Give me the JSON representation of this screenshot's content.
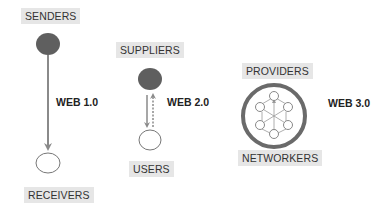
{
  "diagram": {
    "type": "web-evolution-comparison",
    "colors": {
      "filled_node": "#5f5f5f",
      "empty_node_stroke": "#777777",
      "arrow": "#8a8a8a",
      "ring": "#6a6a6a",
      "label_bg": "#e6e6e6",
      "label_text": "#333333"
    },
    "web1": {
      "version_label": "WEB 1.0",
      "top_label": "SENDERS",
      "bottom_label": "RECEIVERS",
      "flow": "one-way downward"
    },
    "web2": {
      "version_label": "WEB 2.0",
      "top_label": "SUPPLIERS",
      "bottom_label": "USERS",
      "flow": "two-way (solid down, dashed up)"
    },
    "web3": {
      "version_label": "WEB 3.0",
      "top_label": "PROVIDERS",
      "bottom_label": "NETWORKERS",
      "flow": "networked hub with 6 peer nodes inside ring"
    }
  }
}
